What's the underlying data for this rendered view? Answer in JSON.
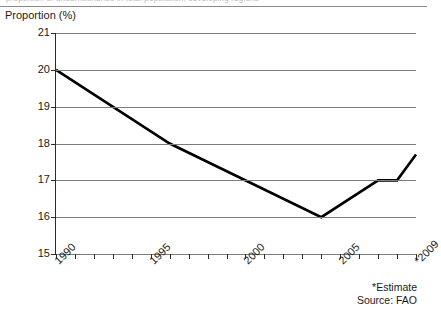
{
  "page": {
    "cutoff_text_top": "proportion of undernourished in total population, developing regions"
  },
  "chart_data": {
    "type": "line",
    "title": "",
    "subtitle": "",
    "ylabel": "Proportion (%)",
    "xlabel": "",
    "ylim": [
      15,
      21
    ],
    "xlim": [
      1990,
      2009
    ],
    "grid": true,
    "legend": "none",
    "y_ticks": [
      21,
      20,
      19,
      18,
      17,
      16,
      15
    ],
    "y_tick_labels": [
      "21",
      "20",
      "19",
      "18",
      "17",
      "16",
      "15"
    ],
    "x_tick_labels": [
      "1990",
      "1995",
      "2000",
      "2005",
      "*2009"
    ],
    "x_tick_label_years": [
      1990,
      1995,
      2000,
      2005,
      2009
    ],
    "x_minor_tick_years": [
      1990,
      1991,
      1992,
      1993,
      1994,
      1995,
      1996,
      1997,
      1998,
      1999,
      2000,
      2001,
      2002,
      2003,
      2004,
      2005,
      2006,
      2007,
      2008,
      2009
    ],
    "x": [
      1990,
      1996,
      2004,
      2007,
      2008,
      2009
    ],
    "values": [
      20.0,
      18.0,
      16.0,
      17.0,
      17.0,
      17.7
    ],
    "series": [
      {
        "name": "Proportion undernourished",
        "color": "#000000",
        "x": [
          1990,
          1996,
          2004,
          2007,
          2008,
          2009
        ],
        "values": [
          20.0,
          18.0,
          16.0,
          17.0,
          17.0,
          17.7
        ]
      }
    ],
    "annotations": [
      "*Estimate",
      "Source: FAO"
    ],
    "colors": {
      "line": "#000000",
      "grid": "#7d7d7d",
      "axis": "#2b2b2b",
      "text": "#1a1a1a",
      "background": "#ffffff"
    }
  },
  "notes": {
    "estimate": "*Estimate",
    "source": "Source: FAO"
  }
}
